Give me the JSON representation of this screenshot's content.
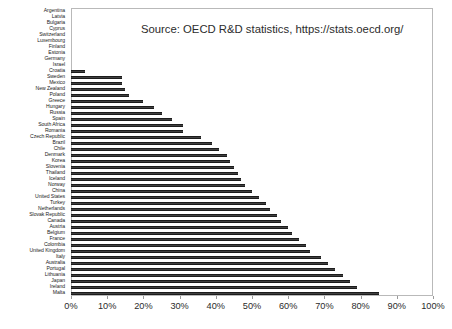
{
  "chart_data": {
    "type": "bar",
    "orientation": "horizontal",
    "title": "",
    "subtitle": "",
    "xlabel": "",
    "ylabel": "",
    "xlim": [
      0,
      100
    ],
    "xtick_labels": [
      "0%",
      "10%",
      "20%",
      "30%",
      "40%",
      "50%",
      "60%",
      "70%",
      "80%",
      "90%",
      "100%"
    ],
    "xtick_values": [
      0,
      10,
      20,
      30,
      40,
      50,
      60,
      70,
      80,
      90,
      100
    ],
    "grid": false,
    "legend": null,
    "bar_color": "#404040",
    "annotations": [
      {
        "name": "source-note",
        "text": "Source: OECD R&D statistics, https://stats.oecd.org/"
      }
    ],
    "categories": [
      "Argentina",
      "Latvia",
      "Bulgaria",
      "Cyprus",
      "Switzerland",
      "Luxembourg",
      "Finland",
      "Estonia",
      "Germany",
      "Israel",
      "Croatia",
      "Sweden",
      "Mexico",
      "New Zealand",
      "Poland",
      "Greece",
      "Hungary",
      "Russia",
      "Spain",
      "South Africa",
      "Romania",
      "Czech Republic",
      "Brazil",
      "Chile",
      "Denmark",
      "Korea",
      "Slovenia",
      "Thailand",
      "Iceland",
      "Norway",
      "China",
      "United States",
      "Turkey",
      "Netherlands",
      "Slovak Republic",
      "Canada",
      "Austria",
      "Belgium",
      "France",
      "Colombia",
      "United Kingdom",
      "Italy",
      "Australia",
      "Portugal",
      "Lithuania",
      "Japan",
      "Ireland",
      "Malta"
    ],
    "values": [
      0,
      0,
      0,
      0,
      0,
      0,
      0,
      0,
      0,
      0,
      4,
      14,
      14,
      15,
      16,
      20,
      23,
      25,
      28,
      31,
      31,
      36,
      39,
      41,
      43,
      44,
      45,
      46,
      47,
      48,
      50,
      52,
      54,
      55,
      57,
      58,
      60,
      61,
      63,
      65,
      66,
      69,
      71,
      73,
      75,
      77,
      79,
      85
    ]
  }
}
